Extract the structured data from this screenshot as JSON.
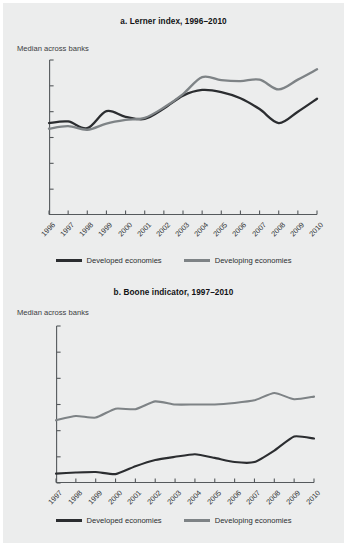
{
  "figure": {
    "background": "#eceded",
    "colors": {
      "developed": "#2b2d30",
      "developing": "#7e8386",
      "axis": "#55595c",
      "text": "#2f3133"
    }
  },
  "panel_a": {
    "title": "a.  Lerner index, 1996–2010",
    "axis_note": "Median across banks",
    "legend": [
      {
        "label": "Developed economies",
        "color": "#2b2d30"
      },
      {
        "label": "Developing economies",
        "color": "#7e8386"
      }
    ]
  },
  "panel_b": {
    "title": "b.  Boone indicator, 1997–2010",
    "axis_note": "Median across banks",
    "legend": [
      {
        "label": "Developed economies",
        "color": "#2b2d30"
      },
      {
        "label": "Developing economies",
        "color": "#7e8386"
      }
    ]
  },
  "chart_data": [
    {
      "type": "line",
      "id": "lerner-index",
      "title": "a.  Lerner index, 1996–2010",
      "subtitle": "Median across banks",
      "xlabel": "",
      "ylabel": "Median across banks",
      "x": [
        1996,
        1997,
        1998,
        1999,
        2000,
        2001,
        2002,
        2003,
        2004,
        2005,
        2006,
        2007,
        2008,
        2009,
        2010
      ],
      "categories": [
        "1996",
        "1997",
        "1998",
        "1999",
        "2000",
        "2001",
        "2002",
        "2003",
        "2004",
        "2005",
        "2006",
        "2007",
        "2008",
        "2009",
        "2010"
      ],
      "ylim": [
        0.0,
        0.3
      ],
      "yticks": [
        0.05,
        0.1,
        0.15,
        0.2,
        0.25,
        0.3
      ],
      "ytick_labels": [
        "0.05",
        "0.10",
        "0.15",
        "0.20",
        "0.25",
        "0.30"
      ],
      "grid": false,
      "legend_position": "bottom",
      "series": [
        {
          "name": "Developed economies",
          "color": "#2b2d30",
          "values": [
            0.178,
            0.181,
            0.168,
            0.201,
            0.19,
            0.186,
            0.206,
            0.231,
            0.242,
            0.238,
            0.226,
            0.205,
            0.178,
            0.2,
            0.225
          ]
        },
        {
          "name": "Developing economies",
          "color": "#7e8386",
          "values": [
            0.167,
            0.172,
            0.165,
            0.177,
            0.184,
            0.188,
            0.208,
            0.234,
            0.267,
            0.261,
            0.259,
            0.262,
            0.243,
            0.262,
            0.282
          ]
        }
      ]
    },
    {
      "type": "line",
      "id": "boone-indicator",
      "title": "b.  Boone indicator, 1997–2010",
      "subtitle": "Median across banks",
      "xlabel": "",
      "ylabel": "Median across banks",
      "x": [
        1997,
        1998,
        1999,
        2000,
        2001,
        2002,
        2003,
        2004,
        2005,
        2006,
        2007,
        2008,
        2009,
        2010
      ],
      "categories": [
        "1997",
        "1998",
        "1999",
        "2000",
        "2001",
        "2002",
        "2003",
        "2004",
        "2005",
        "2006",
        "2007",
        "2008",
        "2009",
        "2010"
      ],
      "ylim": [
        -0.03,
        0.0
      ],
      "yticks": [
        -0.03,
        -0.025,
        -0.02,
        -0.015,
        -0.01,
        -0.005,
        0.0
      ],
      "ytick_labels": [
        "−0.030",
        "−0.025",
        "−0.020",
        "−0.015",
        "−0.010",
        "−0.005",
        "0.000"
      ],
      "grid": false,
      "legend_position": "bottom",
      "series": [
        {
          "name": "Developed economies",
          "color": "#2b2d30",
          "values": [
            -0.0282,
            -0.028,
            -0.0279,
            -0.0283,
            -0.0268,
            -0.0256,
            -0.025,
            -0.0245,
            -0.0252,
            -0.026,
            -0.026,
            -0.0238,
            -0.0211,
            -0.0215
          ]
        },
        {
          "name": "Developing economies",
          "color": "#7e8386",
          "values": [
            -0.018,
            -0.0172,
            -0.0175,
            -0.0158,
            -0.0159,
            -0.0144,
            -0.015,
            -0.015,
            -0.015,
            -0.0147,
            -0.0142,
            -0.0128,
            -0.014,
            -0.0135
          ]
        }
      ]
    }
  ]
}
